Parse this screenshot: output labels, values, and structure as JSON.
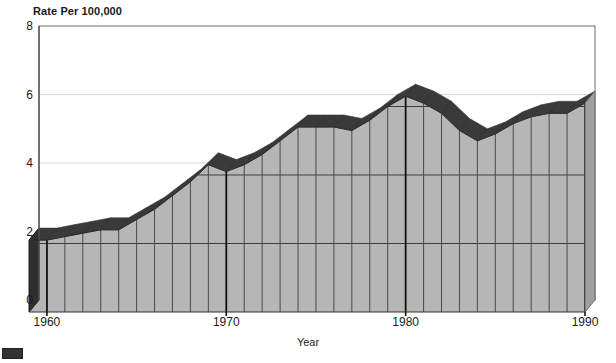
{
  "chart_data": {
    "type": "area",
    "title": "Rate Per 100,000",
    "xlabel": "Year",
    "ylabel": "Rate Per 100,000",
    "ylim": [
      0,
      8
    ],
    "xlim": [
      1959,
      1991
    ],
    "grid": true,
    "legend": "none",
    "style": "3d-ribbon-area",
    "y_ticks": [
      "0",
      "2",
      "4",
      "6",
      "8"
    ],
    "y_tick_values": [
      0,
      2,
      4,
      6,
      8
    ],
    "x_ticks": [
      "1960",
      "1970",
      "1980",
      "1990"
    ],
    "x_tick_values": [
      1960,
      1970,
      1980,
      1990
    ],
    "x": [
      1959,
      1960,
      1961,
      1962,
      1963,
      1964,
      1965,
      1966,
      1967,
      1968,
      1969,
      1970,
      1971,
      1972,
      1973,
      1974,
      1975,
      1976,
      1977,
      1978,
      1979,
      1980,
      1981,
      1982,
      1983,
      1984,
      1985,
      1986,
      1987,
      1988,
      1989,
      1990
    ],
    "values": [
      2.1,
      2.1,
      2.2,
      2.3,
      2.4,
      2.4,
      2.7,
      3.0,
      3.4,
      3.8,
      4.3,
      4.1,
      4.3,
      4.6,
      5.0,
      5.4,
      5.4,
      5.4,
      5.3,
      5.6,
      6.0,
      6.3,
      6.1,
      5.8,
      5.3,
      5.0,
      5.2,
      5.5,
      5.7,
      5.8,
      5.8,
      6.1
    ],
    "series_name": "Rate Per 100,000"
  },
  "axis": {
    "y_title": "Rate Per 100,000",
    "x_title": "Year"
  },
  "legend_marker": {
    "name": "ribbon-top-swatch",
    "color": "#333333"
  },
  "colors": {
    "ribbon_top": "#3a3a3a",
    "front_face": "#b6b6b6",
    "side_face": "#2e2e2e",
    "axis": "#555555",
    "gridline_front": "#3c3c3c",
    "gridline_back": "#ffffff",
    "plot_border": "#6b6b6b"
  }
}
